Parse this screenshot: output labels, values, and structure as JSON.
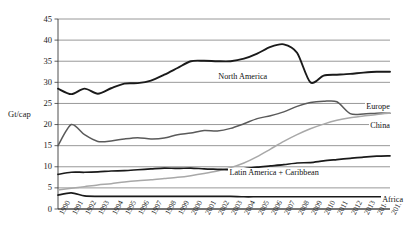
{
  "chart_data": {
    "type": "line",
    "title": "",
    "xlabel": "",
    "ylabel": "Gt/cap",
    "ylim": [
      0,
      45
    ],
    "yticks": [
      0,
      5,
      10,
      15,
      20,
      25,
      30,
      35,
      40,
      45
    ],
    "grid": true,
    "legend_position": "inline-right",
    "x": [
      1990,
      1991,
      1992,
      1993,
      1994,
      1995,
      1996,
      1997,
      1998,
      1999,
      2000,
      2001,
      2002,
      2003,
      2004,
      2005,
      2006,
      2007,
      2008,
      2009,
      2010,
      2011,
      2012,
      2013,
      2014,
      2015
    ],
    "series": [
      {
        "name": "North America",
        "color": "#1a1a1a",
        "width": 1.9,
        "values": [
          28.5,
          27.2,
          28.5,
          27.3,
          28.6,
          29.7,
          29.8,
          30.4,
          31.8,
          33.4,
          35.0,
          35.1,
          35.0,
          35.0,
          35.6,
          36.8,
          38.4,
          39.0,
          37.0,
          30.0,
          31.6,
          31.8,
          32.0,
          32.3,
          32.5,
          32.5
        ]
      },
      {
        "name": "Europe",
        "color": "#5a5a5a",
        "width": 1.5,
        "values": [
          15.0,
          20.0,
          17.6,
          16.0,
          16.1,
          16.6,
          16.9,
          16.6,
          16.8,
          17.6,
          18.0,
          18.6,
          18.5,
          19.1,
          20.2,
          21.4,
          22.1,
          23.0,
          24.3,
          25.2,
          25.5,
          25.4,
          22.6,
          22.5,
          22.7,
          22.7
        ]
      },
      {
        "name": "China",
        "color": "#a8a8a8",
        "width": 1.5,
        "values": [
          4.5,
          4.9,
          5.3,
          5.7,
          6.0,
          6.4,
          6.7,
          6.9,
          7.2,
          7.5,
          7.9,
          8.4,
          9.0,
          9.8,
          10.9,
          12.4,
          14.2,
          16.0,
          17.6,
          19.0,
          20.1,
          21.0,
          21.6,
          22.0,
          22.4,
          22.7
        ]
      },
      {
        "name": "Latin America + Caribbean",
        "color": "#1a1a1a",
        "width": 1.7,
        "values": [
          8.2,
          8.7,
          8.7,
          8.8,
          9.0,
          9.1,
          9.3,
          9.5,
          9.7,
          9.6,
          9.7,
          9.5,
          9.4,
          9.3,
          9.5,
          9.9,
          10.2,
          10.5,
          10.9,
          11.0,
          11.4,
          11.7,
          12.0,
          12.3,
          12.5,
          12.6
        ]
      },
      {
        "name": "Africa",
        "color": "#1a1a1a",
        "width": 1.7,
        "values": [
          3.3,
          3.8,
          3.1,
          3.0,
          3.0,
          3.0,
          3.0,
          3.0,
          3.0,
          3.0,
          3.0,
          3.0,
          3.0,
          3.0,
          2.9,
          2.9,
          2.9,
          2.9,
          2.9,
          2.9,
          2.9,
          2.9,
          2.9,
          2.9,
          2.9,
          2.9
        ]
      }
    ],
    "annotations": [
      {
        "text": "North America",
        "x": 2002.0,
        "y": 31.3
      },
      {
        "text": "Europe",
        "x": 2011.6,
        "y": 24.2
      },
      {
        "text": "China",
        "x": 2011.6,
        "y": 19.6
      },
      {
        "text": "Latin America + Caribbean",
        "x": 2007.5,
        "y": 8.5
      },
      {
        "text": "Africa",
        "x": 2012.6,
        "y": 2.1
      }
    ]
  },
  "axis": {
    "y_title": "Gt/cap",
    "y_tick_labels": [
      "45",
      "40",
      "35",
      "30",
      "25",
      "20",
      "15",
      "10",
      "5",
      "0"
    ],
    "x_tick_labels": [
      "1990",
      "1991",
      "1992",
      "1993",
      "1994",
      "1995",
      "1996",
      "1997",
      "1998",
      "1999",
      "2000",
      "2001",
      "2002",
      "2003",
      "2004",
      "2005",
      "2006",
      "2007",
      "2008",
      "2009",
      "2010",
      "2011",
      "2012",
      "2013",
      "2014",
      "2015"
    ]
  }
}
